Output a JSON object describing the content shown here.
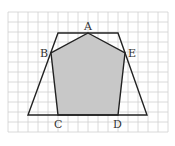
{
  "grid": {
    "x0": 8,
    "y0": 12,
    "cols": 16,
    "rows": 12,
    "cell": 10,
    "color": "#d0d0d0"
  },
  "trapezoid": {
    "points": [
      [
        58,
        33
      ],
      [
        118,
        33
      ],
      [
        147,
        115
      ],
      [
        28,
        115
      ]
    ],
    "stroke": "#222222"
  },
  "pentagon": {
    "fill": "#c8c8c8",
    "stroke": "#222222",
    "vertices": {
      "A": [
        88,
        33
      ],
      "E": [
        125,
        53
      ],
      "D": [
        118,
        115
      ],
      "C": [
        58,
        115
      ],
      "B": [
        51,
        53
      ]
    }
  },
  "labels": [
    {
      "text": "A",
      "x": 84,
      "y": 30
    },
    {
      "text": "B",
      "x": 40,
      "y": 57
    },
    {
      "text": "E",
      "x": 128,
      "y": 57
    },
    {
      "text": "C",
      "x": 54,
      "y": 128
    },
    {
      "text": "D",
      "x": 113,
      "y": 128
    }
  ]
}
